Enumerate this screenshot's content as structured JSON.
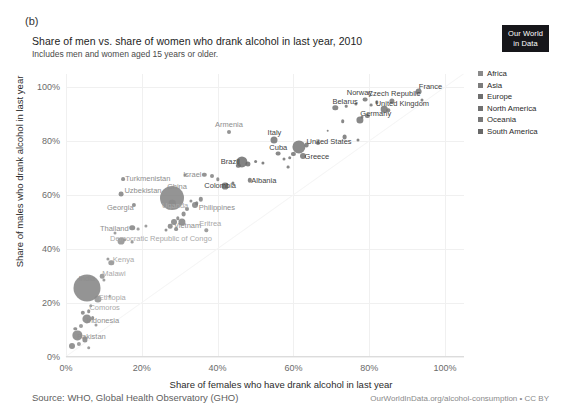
{
  "panel_letter": "(b)",
  "header": {
    "title": "Share of men vs. share of women who drank alcohol in last year, 2010",
    "subtitle": "Includes men and women aged 15 years or older.",
    "logo_line1": "Our World",
    "logo_line2": "in Data"
  },
  "footer": {
    "source": "Source: WHO, Global Health Observatory (GHO)",
    "url": "OurWorldInData.org/alcohol-consumption • CC BY"
  },
  "legend": {
    "items": [
      {
        "label": "Africa",
        "color": "#8a8a8a"
      },
      {
        "label": "Asia",
        "color": "#7c7c7c"
      },
      {
        "label": "Europe",
        "color": "#6e6e6e"
      },
      {
        "label": "North America",
        "color": "#707070"
      },
      {
        "label": "Oceania",
        "color": "#777777"
      },
      {
        "label": "South America",
        "color": "#686868"
      }
    ]
  },
  "chart_data": {
    "type": "scatter",
    "title": "Share of men vs. share of women who drank alcohol in last year, 2010",
    "subtitle": "Includes men and women aged 15 years or older.",
    "xlabel": "Share of females who have drank alcohol in last year",
    "ylabel": "Share of males who drank alcohol in last year",
    "xlim": [
      0,
      105
    ],
    "ylim": [
      0,
      105
    ],
    "xticks": [
      "0%",
      "20%",
      "40%",
      "60%",
      "80%",
      "100%"
    ],
    "xtick_values": [
      0,
      20,
      40,
      60,
      80,
      100
    ],
    "yticks": [
      "0%",
      "20%",
      "40%",
      "60%",
      "80%",
      "100%"
    ],
    "ytick_values": [
      0,
      20,
      40,
      60,
      80,
      100
    ],
    "grid": true,
    "legend_position": "right",
    "size_encoding": "population",
    "color_encoding": "world region",
    "points": [
      {
        "name": "France",
        "x": 93.0,
        "y": 98.5,
        "r": 3.4,
        "region": "Europe",
        "label": true,
        "lx": 12,
        "ly": -6
      },
      {
        "name": "Czech Republic",
        "x": 86.0,
        "y": 95.0,
        "r": 2.6,
        "region": "Europe",
        "label": true,
        "lx": 2,
        "ly": -8
      },
      {
        "name": "Norway",
        "x": 79.0,
        "y": 95.5,
        "r": 2.4,
        "region": "Europe",
        "label": true,
        "lx": -6,
        "ly": -8
      },
      {
        "name": "United Kingdom",
        "x": 84.0,
        "y": 92.0,
        "r": 3.3,
        "region": "Europe",
        "label": true,
        "lx": 18,
        "ly": -6
      },
      {
        "name": "Belarus",
        "x": 71.0,
        "y": 92.5,
        "r": 2.7,
        "region": "Europe",
        "label": true,
        "lx": 10,
        "ly": -7
      },
      {
        "name": "Germany",
        "x": 77.5,
        "y": 88.0,
        "r": 3.6,
        "region": "Europe",
        "label": true,
        "lx": 16,
        "ly": -7
      },
      {
        "name": "Italy",
        "x": 55.0,
        "y": 80.5,
        "r": 3.5,
        "region": "Europe",
        "label": true,
        "lx": 0,
        "ly": -8
      },
      {
        "name": "Armenia",
        "x": 43.0,
        "y": 83.5,
        "r": 2.0,
        "region": "Asia",
        "label": true,
        "lx": 0,
        "ly": -8
      },
      {
        "name": "United States",
        "x": 61.5,
        "y": 78.0,
        "r": 6.6,
        "region": "North America",
        "label": true,
        "lx": 30,
        "ly": -6
      },
      {
        "name": "Greece",
        "x": 62.5,
        "y": 74.5,
        "r": 3.0,
        "region": "Europe",
        "label": true,
        "lx": 14,
        "ly": 0
      },
      {
        "name": "Cuba",
        "x": 56.0,
        "y": 75.5,
        "r": 2.4,
        "region": "North America",
        "label": true,
        "lx": 0,
        "ly": -7
      },
      {
        "name": "Brazil",
        "x": 46.5,
        "y": 72.5,
        "r": 5.6,
        "region": "South America",
        "label": true,
        "lx": -12,
        "ly": -1
      },
      {
        "name": "Israel",
        "x": 36.5,
        "y": 67.5,
        "r": 2.2,
        "region": "Asia",
        "label": true,
        "lx": -12,
        "ly": -1
      },
      {
        "name": "Albania",
        "x": 48.5,
        "y": 65.5,
        "r": 2.2,
        "region": "Europe",
        "label": true,
        "lx": 14,
        "ly": 0
      },
      {
        "name": "Colombia",
        "x": 42.0,
        "y": 63.5,
        "r": 3.4,
        "region": "South America",
        "label": true,
        "lx": -5,
        "ly": -1
      },
      {
        "name": "Turkmenistan",
        "x": 15.0,
        "y": 66.0,
        "r": 1.9,
        "region": "Asia",
        "label": true,
        "lx": 25,
        "ly": -1
      },
      {
        "name": "Uzbekistan",
        "x": 14.5,
        "y": 60.5,
        "r": 2.4,
        "region": "Asia",
        "label": true,
        "lx": 22,
        "ly": -4
      },
      {
        "name": "China",
        "x": 28.0,
        "y": 59.0,
        "r": 12.0,
        "region": "Asia",
        "label": true,
        "lx": 5,
        "ly": -12
      },
      {
        "name": "Uganda",
        "x": 28.0,
        "y": 57.0,
        "r": 3.2,
        "region": "Africa",
        "label": true,
        "lx": 3,
        "ly": 2
      },
      {
        "name": "Georgia",
        "x": 18.0,
        "y": 56.5,
        "r": 2.1,
        "region": "Asia",
        "label": true,
        "lx": -14,
        "ly": 2
      },
      {
        "name": "Philippines",
        "x": 34.0,
        "y": 56.5,
        "r": 3.0,
        "region": "Asia",
        "label": true,
        "lx": 22,
        "ly": 2
      },
      {
        "name": "Vietnam",
        "x": 30.5,
        "y": 50.0,
        "r": 3.6,
        "region": "Asia",
        "label": true,
        "lx": 6,
        "ly": 3
      },
      {
        "name": "Eritrea",
        "x": 37.0,
        "y": 47.0,
        "r": 1.7,
        "region": "Africa",
        "label": true,
        "lx": 4,
        "ly": -7
      },
      {
        "name": "Thailand",
        "x": 17.5,
        "y": 48.0,
        "r": 2.8,
        "region": "Asia",
        "label": true,
        "lx": -18,
        "ly": 0
      },
      {
        "name": "Democratic Republic of Congo",
        "x": 14.5,
        "y": 43.0,
        "r": 3.4,
        "region": "Africa",
        "label": true,
        "lx": 40,
        "ly": -3
      },
      {
        "name": "Kenya",
        "x": 12.0,
        "y": 35.0,
        "r": 2.7,
        "region": "Africa",
        "label": true,
        "lx": 12,
        "ly": -4
      },
      {
        "name": "Malawi",
        "x": 9.5,
        "y": 30.0,
        "r": 2.3,
        "region": "Africa",
        "label": true,
        "lx": 12,
        "ly": -3
      },
      {
        "name": "India",
        "x": 5.5,
        "y": 25.5,
        "r": 13.5,
        "region": "Asia",
        "label": true,
        "lx": 0,
        "ly": -10
      },
      {
        "name": "Ethiopia",
        "x": 8.5,
        "y": 21.5,
        "r": 3.6,
        "region": "Africa",
        "label": true,
        "lx": 14,
        "ly": -2
      },
      {
        "name": "Comoros",
        "x": 6.5,
        "y": 19.0,
        "r": 1.7,
        "region": "Africa",
        "label": true,
        "lx": 14,
        "ly": 1
      },
      {
        "name": "Indonesia",
        "x": 5.5,
        "y": 14.0,
        "r": 4.6,
        "region": "Asia",
        "label": true,
        "lx": 16,
        "ly": 1
      },
      {
        "name": "Pakistan",
        "x": 3.0,
        "y": 8.0,
        "r": 4.6,
        "region": "Asia",
        "label": true,
        "lx": 14,
        "ly": 1
      },
      {
        "name": "u1",
        "x": 94.0,
        "y": 95.5,
        "r": 1.5,
        "region": "Europe"
      },
      {
        "name": "u2",
        "x": 82.0,
        "y": 94.5,
        "r": 1.7,
        "region": "Europe"
      },
      {
        "name": "u3",
        "x": 80.5,
        "y": 93.5,
        "r": 1.4,
        "region": "Europe"
      },
      {
        "name": "u4",
        "x": 76.5,
        "y": 94.0,
        "r": 1.6,
        "region": "Europe"
      },
      {
        "name": "u5",
        "x": 74.0,
        "y": 93.0,
        "r": 1.3,
        "region": "Europe"
      },
      {
        "name": "u6",
        "x": 85.0,
        "y": 91.5,
        "r": 1.7,
        "region": "Europe"
      },
      {
        "name": "u7",
        "x": 79.5,
        "y": 89.5,
        "r": 2.1,
        "region": "Europe"
      },
      {
        "name": "u8",
        "x": 78.0,
        "y": 89.0,
        "r": 1.5,
        "region": "Europe"
      },
      {
        "name": "u9",
        "x": 73.0,
        "y": 87.5,
        "r": 1.8,
        "region": "Europe"
      },
      {
        "name": "u10",
        "x": 73.5,
        "y": 81.5,
        "r": 2.4,
        "region": "Europe"
      },
      {
        "name": "u11",
        "x": 77.0,
        "y": 80.5,
        "r": 1.5,
        "region": "Europe"
      },
      {
        "name": "u12",
        "x": 69.0,
        "y": 84.0,
        "r": 1.3,
        "region": "Europe"
      },
      {
        "name": "u13",
        "x": 66.5,
        "y": 79.5,
        "r": 2.0,
        "region": "Europe"
      },
      {
        "name": "u14",
        "x": 63.5,
        "y": 78.5,
        "r": 2.4,
        "region": "Europe"
      },
      {
        "name": "u15",
        "x": 60.0,
        "y": 75.5,
        "r": 2.1,
        "region": "Europe"
      },
      {
        "name": "u16",
        "x": 59.0,
        "y": 74.0,
        "r": 1.8,
        "region": "Europe"
      },
      {
        "name": "u17",
        "x": 57.5,
        "y": 73.5,
        "r": 1.5,
        "region": "Europe"
      },
      {
        "name": "u18",
        "x": 58.5,
        "y": 70.5,
        "r": 1.4,
        "region": "Europe"
      },
      {
        "name": "u19",
        "x": 52.0,
        "y": 72.0,
        "r": 1.6,
        "region": "South America"
      },
      {
        "name": "u20",
        "x": 50.0,
        "y": 72.5,
        "r": 1.9,
        "region": "South America"
      },
      {
        "name": "u21",
        "x": 48.0,
        "y": 71.5,
        "r": 2.6,
        "region": "South America"
      },
      {
        "name": "u22",
        "x": 45.5,
        "y": 71.0,
        "r": 2.2,
        "region": "South America"
      },
      {
        "name": "u23",
        "x": 38.5,
        "y": 67.0,
        "r": 2.0,
        "region": "Asia"
      },
      {
        "name": "u24",
        "x": 40.0,
        "y": 66.0,
        "r": 1.7,
        "region": "Asia"
      },
      {
        "name": "u25",
        "x": 44.0,
        "y": 64.5,
        "r": 1.6,
        "region": "South America"
      },
      {
        "name": "u26",
        "x": 31.5,
        "y": 67.5,
        "r": 1.5,
        "region": "Asia"
      },
      {
        "name": "u27",
        "x": 35.5,
        "y": 58.5,
        "r": 2.2,
        "region": "Asia"
      },
      {
        "name": "u28",
        "x": 34.5,
        "y": 57.0,
        "r": 1.8,
        "region": "Asia"
      },
      {
        "name": "u29",
        "x": 33.0,
        "y": 58.0,
        "r": 1.6,
        "region": "Asia"
      },
      {
        "name": "u30",
        "x": 32.0,
        "y": 55.0,
        "r": 2.0,
        "region": "Asia"
      },
      {
        "name": "u31",
        "x": 31.0,
        "y": 53.0,
        "r": 2.4,
        "region": "Asia"
      },
      {
        "name": "u32",
        "x": 29.5,
        "y": 51.5,
        "r": 1.7,
        "region": "Asia"
      },
      {
        "name": "u33",
        "x": 28.5,
        "y": 50.0,
        "r": 3.0,
        "region": "Asia"
      },
      {
        "name": "u34",
        "x": 27.5,
        "y": 48.5,
        "r": 2.3,
        "region": "Asia"
      },
      {
        "name": "u35",
        "x": 29.0,
        "y": 47.5,
        "r": 1.9,
        "region": "Asia"
      },
      {
        "name": "u36",
        "x": 26.5,
        "y": 47.0,
        "r": 1.5,
        "region": "Asia"
      },
      {
        "name": "u37",
        "x": 21.0,
        "y": 48.5,
        "r": 1.6,
        "region": "Africa"
      },
      {
        "name": "u38",
        "x": 19.0,
        "y": 47.5,
        "r": 1.4,
        "region": "Africa"
      },
      {
        "name": "u39",
        "x": 13.0,
        "y": 46.0,
        "r": 1.5,
        "region": "Africa"
      },
      {
        "name": "u40",
        "x": 15.5,
        "y": 43.5,
        "r": 1.8,
        "region": "Africa"
      },
      {
        "name": "u41",
        "x": 17.5,
        "y": 42.5,
        "r": 1.4,
        "region": "Africa"
      },
      {
        "name": "u42",
        "x": 11.0,
        "y": 36.5,
        "r": 1.6,
        "region": "Africa"
      },
      {
        "name": "u43",
        "x": 10.0,
        "y": 28.5,
        "r": 1.6,
        "region": "Africa"
      },
      {
        "name": "u44",
        "x": 11.5,
        "y": 22.5,
        "r": 1.3,
        "region": "Africa"
      },
      {
        "name": "u45",
        "x": 6.0,
        "y": 17.0,
        "r": 1.8,
        "region": "Asia"
      },
      {
        "name": "u46",
        "x": 4.5,
        "y": 16.5,
        "r": 2.2,
        "region": "Asia"
      },
      {
        "name": "u47",
        "x": 7.0,
        "y": 14.5,
        "r": 1.9,
        "region": "Asia"
      },
      {
        "name": "u48",
        "x": 8.0,
        "y": 12.0,
        "r": 1.5,
        "region": "Africa"
      },
      {
        "name": "u49",
        "x": 4.0,
        "y": 11.5,
        "r": 2.0,
        "region": "Africa"
      },
      {
        "name": "u50",
        "x": 2.5,
        "y": 10.5,
        "r": 1.7,
        "region": "Asia"
      },
      {
        "name": "u51",
        "x": 5.0,
        "y": 6.5,
        "r": 2.6,
        "region": "Asia"
      },
      {
        "name": "u52",
        "x": 3.5,
        "y": 5.0,
        "r": 2.1,
        "region": "Africa"
      },
      {
        "name": "u53",
        "x": 1.5,
        "y": 4.0,
        "r": 3.0,
        "region": "Asia"
      },
      {
        "name": "u54",
        "x": 6.0,
        "y": 3.5,
        "r": 1.8,
        "region": "Africa"
      }
    ]
  }
}
